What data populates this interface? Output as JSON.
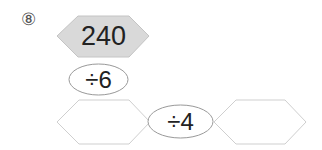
{
  "problem": {
    "number": "⑧",
    "start_value": "240",
    "operations": [
      {
        "label": "÷6"
      },
      {
        "label": "÷4"
      }
    ],
    "answers": [
      {
        "value": ""
      },
      {
        "value": ""
      }
    ]
  },
  "colors": {
    "start_fill": "#d9d9d9",
    "stroke": "#bfbfbf",
    "ellipse_stroke": "#999999",
    "text": "#222222"
  }
}
